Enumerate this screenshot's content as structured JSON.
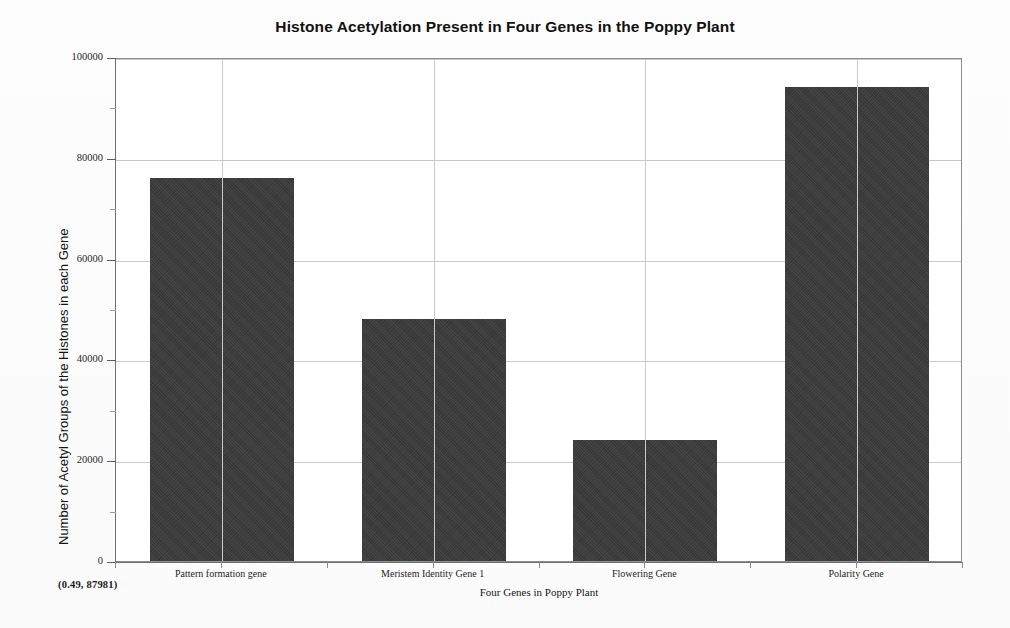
{
  "chart_data": {
    "type": "bar",
    "title": "Histone Acetylation Present in Four Genes in the Poppy Plant",
    "xlabel": "Four Genes in Poppy Plant",
    "ylabel": "Number of Acetyl Groups of the Histones in each Gene",
    "categories": [
      "Pattern formation gene",
      "Meristem Identity Gene 1",
      "Flowering Gene",
      "Polarity Gene"
    ],
    "values": [
      76000,
      48000,
      24000,
      94000
    ],
    "ylim": [
      0,
      100000
    ],
    "y_major_ticks": [
      0,
      20000,
      40000,
      60000,
      80000,
      100000
    ],
    "y_tick_labels": [
      "0",
      "20000",
      "40000",
      "60000",
      "80000",
      "100000"
    ],
    "y_minor_ticks": [
      10000,
      30000,
      50000,
      70000,
      90000
    ],
    "grid": "horizontal-and-vertical",
    "legend": "none",
    "bar_color": "#3a3a3a",
    "grid_color": "#c9c9c9",
    "frame_color": "#8d8d8d",
    "annotation": "(0.49, 87981)"
  }
}
